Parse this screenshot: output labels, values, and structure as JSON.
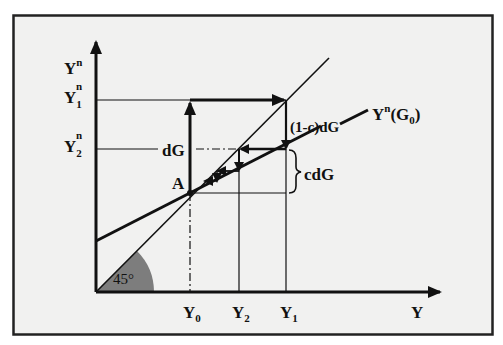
{
  "figure": {
    "type": "Keynesian cross / government spending multiplier diagram",
    "colors": {
      "frame_background": "#f1f1f0",
      "frame_border": "#222222",
      "line": "#111111",
      "angle_fill": "#7d7d7d"
    },
    "axes": {
      "y_axis": {
        "base": "Y",
        "sup": "n"
      },
      "x_axis": {
        "label": "Y"
      }
    },
    "y_ticks": [
      {
        "id": "y1n",
        "base": "Y",
        "sub": "1",
        "sup": "n"
      },
      {
        "id": "y2n",
        "base": "Y",
        "sub": "2",
        "sup": "n"
      }
    ],
    "x_ticks": [
      {
        "id": "y0",
        "base": "Y",
        "sub": "0"
      },
      {
        "id": "y2",
        "base": "Y",
        "sub": "2"
      },
      {
        "id": "y1",
        "base": "Y",
        "sub": "1"
      }
    ],
    "angle_label": "45°",
    "point_label": "A",
    "annotations": {
      "dG": "dG",
      "one_minus_c_dG": "(1-c)dG",
      "cdG": "cdG"
    },
    "curve_label": {
      "base": "Y",
      "sup": "n",
      "rest": "(G",
      "sub": "0",
      "close": ")"
    }
  }
}
